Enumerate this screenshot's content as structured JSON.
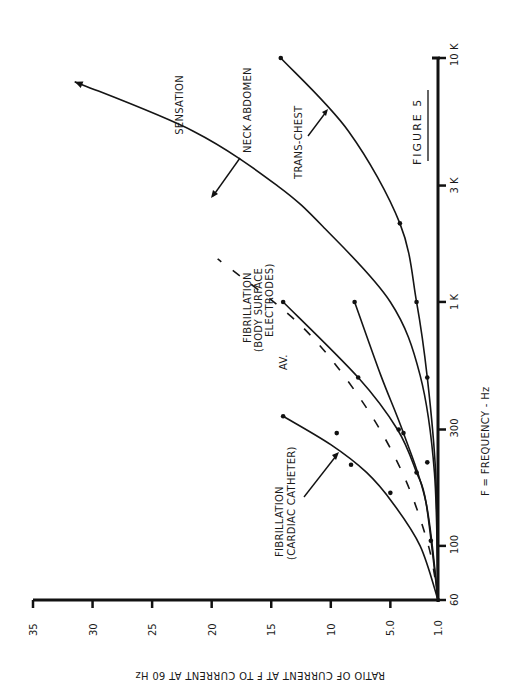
{
  "figure": {
    "title": "FIGURE 5",
    "rotation_deg": -90
  },
  "chart_data": {
    "type": "line",
    "title": "FIGURE 5",
    "xlabel": "F = FREQUENCY - Hz",
    "ylabel": "RATIO OF CURRENT AT F TO CURRENT AT 60 Hz",
    "x_scale": "log",
    "xlim": [
      60,
      10000
    ],
    "ylim": [
      1.0,
      35
    ],
    "x_ticks": [
      60,
      100,
      300,
      1000,
      3000,
      10000
    ],
    "x_tick_labels": [
      "60",
      "100",
      "300",
      "1 K",
      "3 K",
      "10 K"
    ],
    "y_ticks": [
      1.0,
      5.0,
      10,
      15,
      20,
      25,
      30,
      35
    ],
    "y_tick_labels": [
      "1.0",
      "5.0",
      "10",
      "15",
      "20",
      "25",
      "30",
      "35"
    ],
    "grid": false,
    "orientation": "rotated 90° counter-clockwise (frequency axis vertical at right, ratio axis horizontal at bottom)",
    "series": [
      {
        "name": "SENSATION / NECK ABDOMEN",
        "style": "solid",
        "arrow_end": true,
        "x": [
          60,
          200,
          500,
          1000,
          2000,
          3000,
          5000,
          8000
        ],
        "y": [
          1.0,
          1.3,
          2.5,
          5.0,
          10.5,
          14.5,
          21.5,
          31.5
        ],
        "points": []
      },
      {
        "name": "TRANS-CHEST",
        "style": "solid",
        "x": [
          60,
          200,
          490,
          1000,
          2100,
          5000,
          10000
        ],
        "y": [
          1.0,
          1.2,
          1.9,
          2.8,
          4.2,
          8.5,
          14.2
        ],
        "points": [
          {
            "x": 490,
            "y": 1.9
          },
          {
            "x": 1000,
            "y": 2.8
          },
          {
            "x": 2100,
            "y": 4.2
          },
          {
            "x": 10000,
            "y": 14.2
          }
        ]
      },
      {
        "name": "NECK ABDOMEN (measured)",
        "style": "solid",
        "x": [
          60,
          150,
          290,
          500,
          1000
        ],
        "y": [
          1.0,
          2.0,
          3.9,
          5.8,
          8.0
        ],
        "points": [
          {
            "x": 220,
            "y": 1.9
          },
          {
            "x": 290,
            "y": 3.9
          },
          {
            "x": 1000,
            "y": 8.0
          }
        ]
      },
      {
        "name": "FIBRILLATION (BODY SURFACE ELECTRODES)",
        "style": "solid",
        "x": [
          60,
          150,
          200,
          300,
          490,
          1000
        ],
        "y": [
          1.0,
          2.0,
          2.8,
          4.4,
          7.7,
          14.0
        ],
        "points": [
          {
            "x": 200,
            "y": 2.8
          },
          {
            "x": 300,
            "y": 4.3
          },
          {
            "x": 490,
            "y": 7.7
          },
          {
            "x": 1000,
            "y": 14.0
          }
        ]
      },
      {
        "name": "AV.",
        "style": "dashed",
        "x": [
          60,
          100,
          200,
          400,
          800,
          1500
        ],
        "y": [
          1.0,
          1.8,
          4.0,
          7.5,
          12.5,
          19.5
        ],
        "points": []
      },
      {
        "name": "FIBRILLATION (CARDIAC CATHETER)",
        "style": "solid",
        "x": [
          60,
          100,
          150,
          200,
          260,
          340
        ],
        "y": [
          1.0,
          2.5,
          4.8,
          7.0,
          10.0,
          14.0
        ],
        "points": [
          {
            "x": 105,
            "y": 1.6
          },
          {
            "x": 165,
            "y": 5.0
          },
          {
            "x": 215,
            "y": 8.3
          },
          {
            "x": 290,
            "y": 9.5
          },
          {
            "x": 340,
            "y": 14.0
          }
        ]
      }
    ],
    "annotations": [
      "SENSATION",
      "NECK ABDOMEN",
      "TRANS-CHEST",
      "FIBRILLATION (BODY SURFACE ELECTRODES)",
      "AV.",
      "FIBRILLATION (CARDIAC CATHETER)",
      "FIGURE 5"
    ]
  },
  "labels": {
    "sensation": "SENSATION",
    "neck_abdomen": "NECK ABDOMEN",
    "trans_chest": "TRANS-CHEST",
    "fib_body_1": "FIBRILLATION",
    "fib_body_2": "(BODY SURFACE",
    "fib_body_3": "ELECTRODES)",
    "av": "AV.",
    "fib_cath_1": "FIBRILLATION",
    "fib_cath_2": "(CARDIAC CATHETER)",
    "figure": "FIGURE  5",
    "x_axis_title": "F =    FREQUENCY  -  Hz",
    "y_axis_title": "RATIO  OF  CURRENT  AT  F  TO  CURRENT  AT  60 Hz",
    "x_ticks": [
      "60",
      "100",
      "300",
      "1 K",
      "3 K",
      "10 K"
    ],
    "y_ticks": [
      "35",
      "30",
      "25",
      "20",
      "15",
      "10",
      "5.0",
      "1.0"
    ]
  }
}
